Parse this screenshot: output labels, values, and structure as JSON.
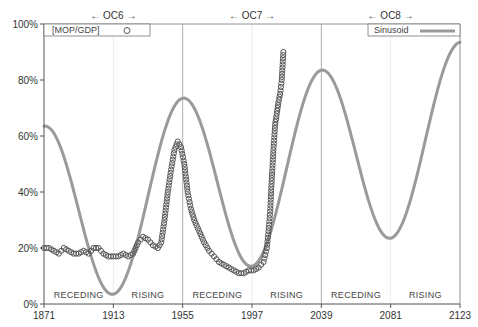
{
  "chart_data": {
    "type": "line",
    "title": "",
    "xlabel": "",
    "ylabel": "",
    "xlim": [
      1871,
      2123
    ],
    "ylim": [
      0,
      100
    ],
    "x_ticks": [
      1871,
      1913,
      1955,
      1997,
      2039,
      2081,
      2123
    ],
    "x_tick_labels": [
      "1871",
      "1913",
      "1955",
      "1997",
      "2039",
      "2081",
      "2123"
    ],
    "y_ticks": [
      0,
      20,
      40,
      60,
      80,
      100
    ],
    "y_tick_labels": [
      "0%",
      "20%",
      "40%",
      "60%",
      "80%",
      "100%"
    ],
    "grid": false,
    "cycle_dividers": [
      1955,
      2039
    ],
    "cycles": [
      {
        "label": "← OC6 →",
        "center": 1913
      },
      {
        "label": "← OC7 →",
        "center": 1997
      },
      {
        "label": "← OC8 →",
        "center": 2081
      }
    ],
    "phase_labels": [
      {
        "label": "RECEDING",
        "x": 1892
      },
      {
        "label": "RISING",
        "x": 1934
      },
      {
        "label": "RECEDING",
        "x": 1976
      },
      {
        "label": "RISING",
        "x": 2018
      },
      {
        "label": "RECEDING",
        "x": 2060
      },
      {
        "label": "RISING",
        "x": 2102
      }
    ],
    "legend": [
      {
        "name": "[MOP/GDP]",
        "marker": "circle",
        "position": "top-left"
      },
      {
        "name": "Sinusoid",
        "marker": "line",
        "position": "top-right"
      }
    ],
    "series": [
      {
        "name": "[MOP/GDP]",
        "style": "circle-markers",
        "color": "#555555",
        "x": [
          1871,
          1874,
          1877,
          1880,
          1883,
          1886,
          1889,
          1892,
          1895,
          1898,
          1901,
          1904,
          1907,
          1910,
          1913,
          1916,
          1919,
          1922,
          1925,
          1928,
          1931,
          1934,
          1937,
          1940,
          1942,
          1944,
          1946,
          1948,
          1950,
          1952,
          1954,
          1956,
          1958,
          1960,
          1962,
          1965,
          1968,
          1971,
          1974,
          1977,
          1980,
          1983,
          1986,
          1989,
          1992,
          1995,
          1998,
          2001,
          2004,
          2006,
          2007,
          2008,
          2009,
          2010,
          2011,
          2012,
          2013,
          2014,
          2015,
          2016
        ],
        "values": [
          20,
          20,
          19,
          18,
          20,
          19,
          18,
          18,
          19,
          18,
          20,
          20,
          18,
          17,
          17,
          17,
          18,
          17,
          18,
          22,
          24,
          23,
          21,
          20,
          22,
          30,
          40,
          48,
          55,
          58,
          56,
          50,
          40,
          34,
          30,
          26,
          22,
          19,
          17,
          15,
          14,
          13,
          12,
          11,
          11,
          12,
          12,
          13,
          15,
          20,
          26,
          33,
          45,
          55,
          64,
          68,
          72,
          75,
          80,
          90
        ]
      },
      {
        "name": "Sinusoid",
        "style": "line",
        "color": "#9a9a9a",
        "x": [
          1871,
          1892,
          1913,
          1934,
          1955,
          1976,
          1997,
          2018,
          2039,
          2060,
          2081,
          2102,
          2123
        ],
        "values": [
          58.5,
          31,
          3.5,
          36,
          68.5,
          41,
          13.5,
          46,
          78.5,
          51,
          23.5,
          56,
          88.5
        ]
      }
    ]
  },
  "legend": {
    "mop_gdp_label": "[MOP/GDP]",
    "sinusoid_label": "Sinusoid"
  }
}
